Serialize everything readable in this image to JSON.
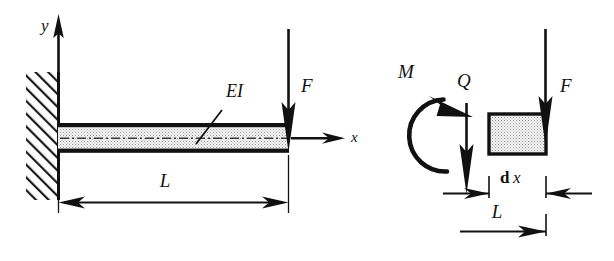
{
  "figure": {
    "background_color": "#ffffff",
    "ink_color": "#111111",
    "beam_fill_color": "#ececec",
    "element_fill_color": "#e8e8e8"
  },
  "left_diagram": {
    "name": "cantilever-beam-diagram",
    "axis_y_label": "y",
    "axis_x_label": "x",
    "beam_stiffness_label": "EI",
    "load_label": "F",
    "length_label": "L",
    "support_type": "fixed-wall-hatched"
  },
  "right_diagram": {
    "name": "free-body-element-diagram",
    "moment_label": "M",
    "shear_label": "Q",
    "load_label": "F",
    "element_width_label": "dx",
    "element_width_label_d": "d",
    "element_width_label_x": "x",
    "position_label": "L"
  }
}
